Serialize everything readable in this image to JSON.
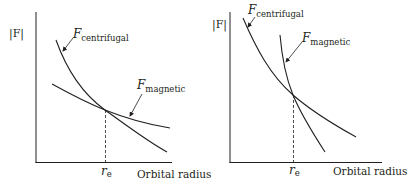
{
  "panels": [
    {
      "y_label": "|F|",
      "x_label": "Orbital radius",
      "intersection_label_main": "r",
      "intersection_label_sub": "e",
      "curves": [
        {
          "symbol": "F",
          "subscript": "centrifugal"
        },
        {
          "symbol": "F",
          "subscript": "magnetic"
        }
      ]
    },
    {
      "y_label": "|F|",
      "x_label": "Orbital radius",
      "intersection_label_main": "r",
      "intersection_label_sub": "e",
      "curves": [
        {
          "symbol": "F",
          "subscript": "centrifugal"
        },
        {
          "symbol": "F",
          "subscript": "magnetic"
        }
      ]
    }
  ],
  "colors": {
    "line": "#231f20",
    "background": "#ffffff"
  }
}
